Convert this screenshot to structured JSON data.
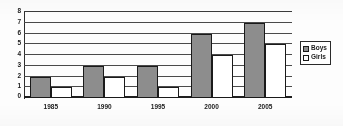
{
  "chart_data": {
    "type": "bar",
    "title": "",
    "xlabel": "",
    "ylabel": "",
    "categories": [
      "1985",
      "1990",
      "1995",
      "2000",
      "2005"
    ],
    "series": [
      {
        "name": "Boys",
        "values": [
          2,
          3,
          3,
          6,
          7
        ]
      },
      {
        "name": "Girls",
        "values": [
          1,
          2,
          1,
          4,
          5
        ]
      }
    ],
    "ylim": [
      0,
      8
    ],
    "ytick_labels": [
      "0",
      "1",
      "2",
      "3",
      "4",
      "5",
      "6",
      "7",
      "8"
    ],
    "ytick_step": 1,
    "grid": true,
    "grid_orientation": "horizontal",
    "legend_position": "right",
    "colors": {
      "boys": "#8d8d8d",
      "girls": "#ffffff",
      "outline": "#1a1a1a",
      "gridline": "#4a4a4a",
      "axis": "#1e1e1e",
      "text": "#1c1c1c"
    }
  },
  "legend": {
    "entries": [
      {
        "label": "Boys",
        "swatch": "boys-swatch-icon"
      },
      {
        "label": "Girls",
        "swatch": "girls-swatch-icon"
      }
    ]
  }
}
